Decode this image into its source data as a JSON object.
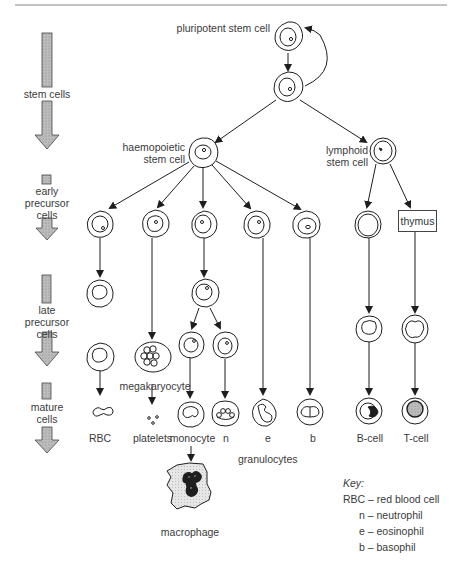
{
  "stages": [
    {
      "label": "stem cells"
    },
    {
      "label": "early\nprecursor\ncells",
      "lines": [
        "early",
        "precursor",
        "cells"
      ]
    },
    {
      "label": "late\nprecursor\ncells",
      "lines": [
        "late",
        "precursor",
        "cells"
      ]
    },
    {
      "label": "mature\ncells",
      "lines": [
        "mature",
        "cells"
      ]
    }
  ],
  "cells": {
    "pluripotent": "pluripotent stem cell",
    "haemopoietic": [
      "haemopoietic",
      "stem cell"
    ],
    "lymphoid": [
      "lymphoid",
      "stem cell"
    ],
    "thymus": "thymus",
    "megakaryocyte": "megakaryocyte",
    "macrophage": "macrophage",
    "granulocytes": "granulocytes"
  },
  "mature_labels": [
    "RBC",
    "platelets",
    "monocyte",
    "n",
    "e",
    "b",
    "B-cell",
    "T-cell"
  ],
  "key": {
    "title": "Key:",
    "entries": [
      "RBC – red blood cell",
      "n – neutrophil",
      "e – eosinophil",
      "b – basophil"
    ]
  },
  "colors": {
    "stage_arrow_fill": "#bdbdbd",
    "stroke": "#1e1e1e",
    "macrophage_fill": "#e4e4e4"
  }
}
